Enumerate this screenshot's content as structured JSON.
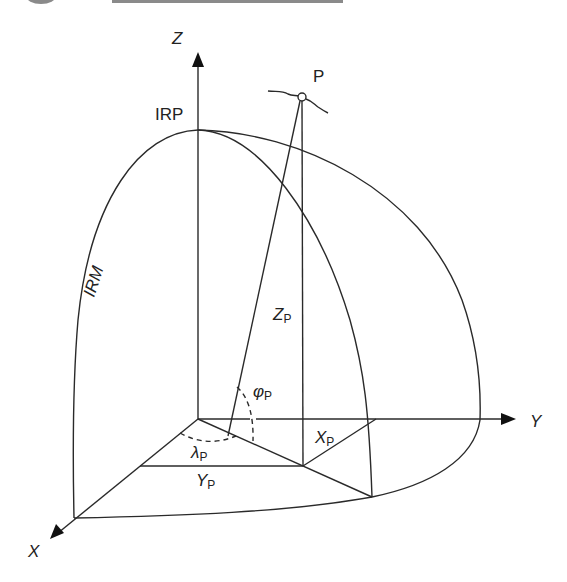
{
  "figure": {
    "type": "3d-coordinate-diagram",
    "colors": {
      "line": "#2a2a2a",
      "background": "#ffffff",
      "header_bar": "#8a8a8a"
    },
    "axes": {
      "z": {
        "label": "Z"
      },
      "y": {
        "label": "Y"
      },
      "x": {
        "label": "X"
      }
    },
    "point": {
      "label": "P"
    },
    "reference_pole": {
      "label": "IRP"
    },
    "reference_meridian": {
      "label": "IRM"
    },
    "quantities": {
      "zp": {
        "main": "Z",
        "sub": "P"
      },
      "xp": {
        "main": "X",
        "sub": "P"
      },
      "yp": {
        "main": "Y",
        "sub": "P"
      },
      "phi": {
        "main": "φ",
        "sub": "P"
      },
      "lambda": {
        "main": "λ",
        "sub": "P"
      }
    }
  }
}
